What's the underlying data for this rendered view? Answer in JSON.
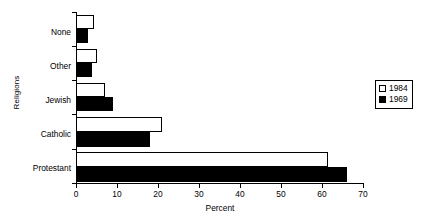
{
  "chart_data": {
    "type": "bar",
    "orientation": "horizontal",
    "title": "",
    "xlabel": "Percent",
    "ylabel": "Religions",
    "categories": [
      "None",
      "Other",
      "Jewish",
      "Catholic",
      "Protestant"
    ],
    "series": [
      {
        "name": "1984",
        "color": "#ffffff",
        "values": [
          4.5,
          5,
          7,
          21,
          61.5
        ]
      },
      {
        "name": "1969",
        "color": "#000000",
        "values": [
          3,
          4,
          9,
          18,
          66
        ]
      }
    ],
    "xlim": [
      0,
      70
    ],
    "xticks": [
      0,
      10,
      20,
      30,
      40,
      50,
      60,
      70
    ],
    "xtick_labels": [
      "0",
      "10",
      "20",
      "30",
      "40",
      "50",
      "60",
      "70"
    ],
    "grid": false,
    "legend_position": "right"
  },
  "axes": {
    "x_title": "Percent",
    "y_title": "Religions"
  },
  "legend": {
    "entries": [
      {
        "label": "1984",
        "swatch": "light-square-icon"
      },
      {
        "label": "1969",
        "swatch": "dark-square-icon"
      }
    ]
  }
}
